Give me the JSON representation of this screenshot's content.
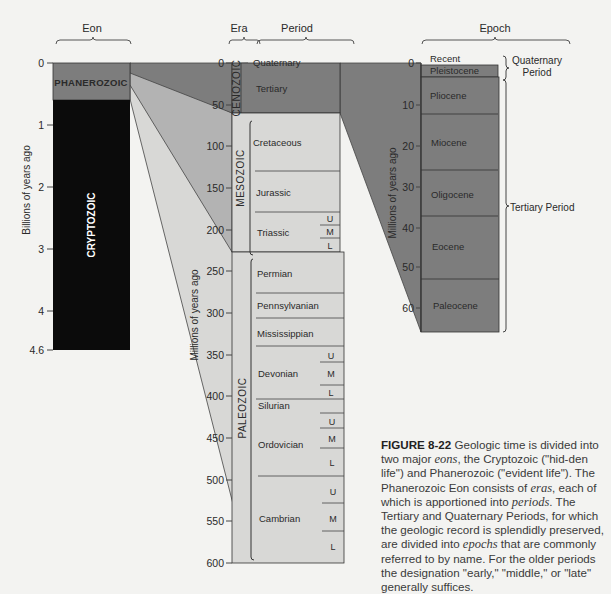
{
  "headers": {
    "eon": "Eon",
    "era": "Era",
    "period": "Period",
    "epoch": "Epoch"
  },
  "axes": {
    "eon_axis_label": "Billions of years ago",
    "eon_ticks": [
      "0",
      "1",
      "2",
      "3",
      "4",
      "4.6"
    ],
    "era_axis_label": "Millions of years ago",
    "era_ticks": [
      "0",
      "50",
      "100",
      "150",
      "200",
      "250",
      "300",
      "350",
      "400",
      "450",
      "500",
      "550",
      "600"
    ],
    "epoch_axis_label": "Millions of years ago",
    "epoch_ticks": [
      "0",
      "10",
      "20",
      "30",
      "40",
      "50",
      "60"
    ]
  },
  "eons": {
    "phanerozoic": "PHANEROZOIC",
    "cryptozoic": "CRYPTOZOIC"
  },
  "eras": {
    "cenozoic": "CENOZOIC",
    "mesozoic": "MESOZOIC",
    "paleozoic": "PALEOZOIC"
  },
  "periods": {
    "quaternary": "Quaternary",
    "tertiary": "Tertiary",
    "cretaceous": "Cretaceous",
    "jurassic": "Jurassic",
    "triassic": "Triassic",
    "permian": "Permian",
    "pennsylvanian": "Pennsylvanian",
    "mississippian": "Mississippian",
    "devonian": "Devonian",
    "silurian": "Silurian",
    "ordovician": "Ordovician",
    "cambrian": "Cambrian"
  },
  "subdivisions": {
    "upper": "U",
    "middle": "M",
    "lower": "L"
  },
  "epochs": {
    "recent": "Recent",
    "pleistocene": "Pleistocene",
    "pliocene": "Pliocene",
    "miocene": "Miocene",
    "oligocene": "Oligocene",
    "eocene": "Eocene",
    "paleocene": "Paleocene"
  },
  "brackets": {
    "quaternary_period_1": "Quaternary",
    "quaternary_period_2": "Period",
    "tertiary_period": "Tertiary Period"
  },
  "caption": {
    "figure_label": "FIGURE 8-22",
    "t1": " Geologic time is divided into two major ",
    "eons": "eons",
    "t2": ", the Cryptozoic (\"hid-den life\") and Phanerozoic (\"evident life\"). The Phanerozoic Eon consists of ",
    "eras": "eras",
    "t3": ", each of which is apportioned into ",
    "periods": "periods",
    "t4": ". The Tertiary and Quaternary Periods, for which the geologic record is splendidly preserved, are divided into ",
    "epochs": "epochs",
    "t5": " that are commonly referred to by name. For the older periods the designation \"early,\" \"middle,\" or \"late\" generally suffices."
  },
  "colors": {
    "dark_gray": "#7d7d7d",
    "mid_gray": "#b3b3b3",
    "light_gray": "#d8d8d6",
    "black": "#0b0b0b",
    "line": "#3a3a3a"
  }
}
